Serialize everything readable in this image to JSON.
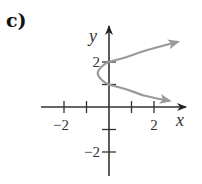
{
  "panel_label": "c)",
  "colors": {
    "axis": "#333333",
    "curve": "#9a9a9a",
    "background": "#ffffff"
  },
  "chart_data": {
    "type": "line",
    "title": "",
    "panel": "c)",
    "xlabel": "x",
    "ylabel": "y",
    "xlim": [
      -3,
      3.4
    ],
    "ylim": [
      -3,
      3.6
    ],
    "x_ticks": [
      -2,
      -1,
      1,
      2
    ],
    "x_tick_labels": [
      {
        "value": -2,
        "label": "−2"
      },
      {
        "value": 2,
        "label": "2"
      }
    ],
    "y_ticks": [
      -2,
      -1,
      1,
      2
    ],
    "y_tick_labels": [
      {
        "value": 2,
        "label": "2"
      },
      {
        "value": -2,
        "label": "−2"
      }
    ],
    "grid": false,
    "legend": null,
    "series": [
      {
        "name": "x = 2(y−1)(y−2)",
        "points": [
          {
            "x": 2.7,
            "y": 0.27
          },
          {
            "x": 1.6,
            "y": 0.5
          },
          {
            "x": 0.72,
            "y": 0.8
          },
          {
            "x": 0.0,
            "y": 1.0
          },
          {
            "x": -0.32,
            "y": 1.2
          },
          {
            "x": -0.5,
            "y": 1.5
          },
          {
            "x": -0.32,
            "y": 1.8
          },
          {
            "x": 0.0,
            "y": 2.0
          },
          {
            "x": 0.72,
            "y": 2.2
          },
          {
            "x": 1.6,
            "y": 2.5
          },
          {
            "x": 3.07,
            "y": 2.9
          }
        ],
        "arrows": "both ends"
      }
    ]
  }
}
